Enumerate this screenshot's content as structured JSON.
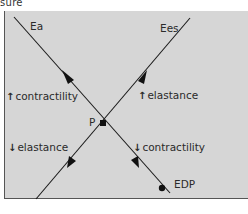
{
  "caption_fragment": "sure",
  "lines": {
    "ea": {
      "label": "Ea"
    },
    "ees": {
      "label": "Ees"
    }
  },
  "points": {
    "p": {
      "label": "P"
    },
    "edp": {
      "label": "EDP"
    }
  },
  "annotations": {
    "up_contractility": {
      "glyph": "↑",
      "text": "contractility"
    },
    "up_elastance": {
      "glyph": "↑",
      "text": "elastance"
    },
    "down_elastance": {
      "glyph": "↓",
      "text": "elastance"
    },
    "down_contractility": {
      "glyph": "↓",
      "text": "contractility"
    }
  },
  "colors": {
    "panel_background": "#d6d6d6",
    "line": "#1a1a1a",
    "text": "#2a2a2a"
  }
}
